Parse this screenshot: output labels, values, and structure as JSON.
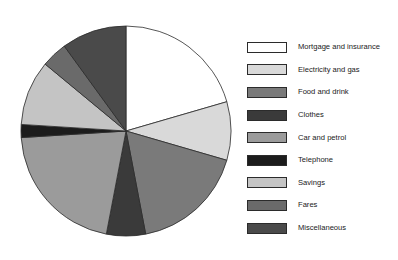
{
  "chart_data": {
    "type": "pie",
    "title": "",
    "subtitle": "",
    "xlabel": "",
    "ylabel": "",
    "grid": false,
    "legend_position": "right",
    "start_angle_deg": 0,
    "direction": "clockwise",
    "categories": [
      "Mortgage and insurance",
      "Electricity and gas",
      "Food and drink",
      "Clothes",
      "Car and petrol",
      "Telephone",
      "Savings",
      "Fares",
      "Miscellaneous"
    ],
    "values": [
      20.5,
      9.0,
      17.5,
      6.0,
      21.0,
      2.0,
      10.0,
      4.0,
      10.0
    ],
    "colors": [
      "#ffffff",
      "#d9d9d9",
      "#7a7a7a",
      "#3a3a3a",
      "#9b9b9b",
      "#1c1c1c",
      "#c4c4c4",
      "#6a6a6a",
      "#4a4a4a"
    ],
    "slice_edge_color": "#2b2b2b"
  },
  "legend": {
    "items": [
      {
        "label": "Mortgage and insurance",
        "color": "#ffffff",
        "value": 20.5
      },
      {
        "label": "Electricity and gas",
        "color": "#d9d9d9",
        "value": 9.0
      },
      {
        "label": "Food and drink",
        "color": "#7a7a7a",
        "value": 17.5
      },
      {
        "label": "Clothes",
        "color": "#3a3a3a",
        "value": 6.0
      },
      {
        "label": "Car and petrol",
        "color": "#9b9b9b",
        "value": 21.0
      },
      {
        "label": "Telephone",
        "color": "#1c1c1c",
        "value": 2.0
      },
      {
        "label": "Savings",
        "color": "#c4c4c4",
        "value": 10.0
      },
      {
        "label": "Fares",
        "color": "#6a6a6a",
        "value": 4.0
      },
      {
        "label": "Miscellaneous",
        "color": "#4a4a4a",
        "value": 10.0
      }
    ]
  }
}
